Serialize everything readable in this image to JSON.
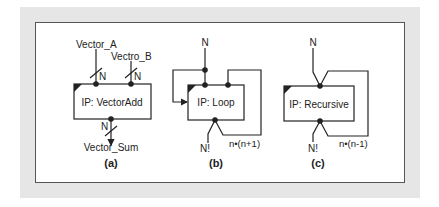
{
  "figure": {
    "panels": [
      {
        "id": "a",
        "caption": "(a)",
        "block_label": "IP: VectorAdd",
        "inputs": [
          {
            "name": "Vector_A",
            "width": "N"
          },
          {
            "name": "Vectro_B",
            "width": "N"
          }
        ],
        "outputs": [
          {
            "name": "Vector_Sum",
            "width": "N"
          }
        ]
      },
      {
        "id": "b",
        "caption": "(b)",
        "block_label": "IP: Loop",
        "input": "N",
        "output": "N!",
        "feedback": "n•(n+1)"
      },
      {
        "id": "c",
        "caption": "(c)",
        "block_label": "IP: Recursive",
        "input": "N",
        "output": "N!",
        "feedback": "n•(n-1)"
      }
    ],
    "colors": {
      "background": "#e6e6e6",
      "frame": "#ffffff",
      "stroke": "#222222"
    }
  }
}
